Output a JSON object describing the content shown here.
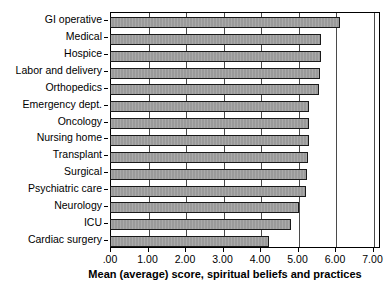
{
  "chart_data": {
    "type": "bar",
    "orientation": "horizontal",
    "title": "",
    "subtitle": "",
    "xlabel": "Mean (average) score, spiritual beliefs and practices",
    "ylabel": "Unit",
    "categories": [
      "GI operative",
      "Medical",
      "Hospice",
      "Labor and delivery",
      "Orthopedics",
      "Emergency dept.",
      "Oncology",
      "Nursing home",
      "Transplant",
      "Surgical",
      "Psychiatric care",
      "Neurology",
      "ICU",
      "Cardiac surgery"
    ],
    "values": [
      6.11,
      5.6,
      5.6,
      5.58,
      5.55,
      5.29,
      5.28,
      5.27,
      5.24,
      5.22,
      5.2,
      5.0,
      4.8,
      4.2
    ],
    "xlim": [
      0,
      7.2
    ],
    "xticks": [
      0,
      1,
      2,
      3,
      4,
      5,
      6,
      7
    ],
    "xtick_labels": [
      ".00",
      "1.00",
      "2.00",
      "3.00",
      "4.00",
      "5.00",
      "6.00",
      "7.00"
    ],
    "grid": true,
    "grid_axis": "x",
    "legend": false,
    "bar_color": "#9a9a9a",
    "bar_edge_color": "#1a1a1a",
    "background_color": "#ffffff"
  }
}
